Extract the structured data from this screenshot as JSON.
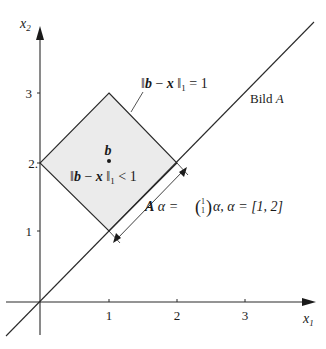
{
  "diagram": {
    "type": "geometry-plot",
    "axes": {
      "x_label": "x",
      "x_label_sub": "1",
      "y_label": "x",
      "y_label_sub": "2",
      "x_ticks": [
        "1",
        "2",
        "3"
      ],
      "y_ticks": [
        "1",
        "2.",
        "3"
      ]
    },
    "region": {
      "shape": "diamond",
      "center": [
        1,
        2
      ],
      "radius_l1": 1,
      "fill": "#ebebeb",
      "boundary_label": "‖b − x‖₁ = 1",
      "boundary_label_parts": {
        "norm_open": "‖",
        "b": "b",
        "minus": " − ",
        "x": "x",
        "norm_close": " ‖",
        "sub": "1",
        "rel": " = 1"
      },
      "interior_label_parts": {
        "norm_open": "‖",
        "b": "b",
        "minus": " − ",
        "x": "x",
        "norm_close": " ‖",
        "sub": "1",
        "rel": " < 1"
      },
      "center_point_label": "b"
    },
    "line": {
      "label": "Bild A",
      "label_text": "Bild ",
      "label_var": "A",
      "equation": "x2 = x1"
    },
    "segment_annotation": {
      "label_A": "A",
      "label_alpha": " α = ",
      "vector_top": "1",
      "vector_bottom": "1",
      "label_rest": "α, α = [1, 2]",
      "alpha_range": [
        1,
        2
      ]
    }
  }
}
